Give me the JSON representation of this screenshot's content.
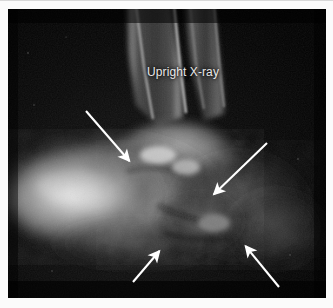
{
  "figure": {
    "domain_kind": "radiograph",
    "width": 333,
    "height": 308,
    "mount_color": "#fbfbfb",
    "film_color": "#030303",
    "annotation_color": "#ffffff",
    "label_color": "#e9e9e9"
  },
  "image": {
    "modality": "X-ray",
    "view_label": "Upright X-ray",
    "body_region": "lateral ankle and hindfoot",
    "alt_text": "Lateral upright radiograph of the ankle and hindfoot showing the distal tibia and fibula above, a diffusely bright soft tissue and bony mass over the midfoot and hindfoot, with four white annotation arrows indicating areas of abnormality."
  },
  "annotations": {
    "arrows": [
      {
        "id": "arrow-upper-left",
        "label": "upper left arrow",
        "direction": "down-right",
        "tail": {
          "x": 86,
          "y": 111
        },
        "head": {
          "x": 132,
          "y": 164
        }
      },
      {
        "id": "arrow-upper-right",
        "label": "upper right arrow",
        "direction": "down-left",
        "tail": {
          "x": 267,
          "y": 143
        },
        "head": {
          "x": 211,
          "y": 197
        }
      },
      {
        "id": "arrow-lower-left",
        "label": "lower left arrow",
        "direction": "up-right",
        "tail": {
          "x": 133,
          "y": 282
        },
        "head": {
          "x": 162,
          "y": 248
        }
      },
      {
        "id": "arrow-lower-right",
        "label": "lower right arrow",
        "direction": "up-left",
        "tail": {
          "x": 279,
          "y": 287
        },
        "head": {
          "x": 243,
          "y": 243
        }
      }
    ]
  },
  "anatomy": {
    "structures": [
      {
        "name": "tibial shaft",
        "position": "upper centre-left"
      },
      {
        "name": "fibular shaft",
        "position": "upper centre-right"
      },
      {
        "name": "talus and ankle joint",
        "position": "mid centre"
      },
      {
        "name": "calcaneus and midfoot soft tissue mass",
        "position": "lower left"
      },
      {
        "name": "posterior hindfoot soft tissue",
        "position": "lower right"
      }
    ]
  }
}
